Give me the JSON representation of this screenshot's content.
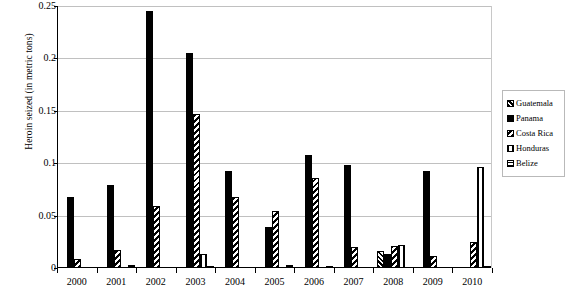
{
  "chart_data": {
    "type": "bar",
    "title": "",
    "xlabel": "",
    "ylabel": "Heroin seized (in metric tons)",
    "categories": [
      "2000",
      "2001",
      "2002",
      "2003",
      "2004",
      "2005",
      "2006",
      "2007",
      "2008",
      "2009",
      "2010"
    ],
    "ylim": [
      0,
      0.25
    ],
    "ytick_labels": [
      "0",
      "0.05",
      "0.1",
      "0.15",
      "0.2",
      "0.25"
    ],
    "ytick_values": [
      0,
      0.05,
      0.1,
      0.15,
      0.2,
      0.25
    ],
    "grid": true,
    "legend_position": "right",
    "series": [
      {
        "name": "Guatemala",
        "pattern": "diagonal-up-hatch",
        "values": [
          0,
          0,
          0,
          0,
          0,
          0,
          0,
          0,
          0.016,
          0,
          0
        ]
      },
      {
        "name": "Panama",
        "pattern": "solid-black",
        "values": [
          0.068,
          0.079,
          0.245,
          0.205,
          0.093,
          0.039,
          0.108,
          0.098,
          0.013,
          0.093,
          0
        ]
      },
      {
        "name": "Costa Rica",
        "pattern": "diagonal-down-hatch",
        "values": [
          0.009,
          0.017,
          0.059,
          0.147,
          0.068,
          0.054,
          0.086,
          0.02,
          0.021,
          0.011,
          0.025
        ]
      },
      {
        "name": "Honduras",
        "pattern": "vertical-hatch",
        "values": [
          0,
          0,
          0,
          0.013,
          0,
          0,
          0,
          0,
          0.022,
          0,
          0.096
        ]
      },
      {
        "name": "Belize",
        "pattern": "horizontal-hatch",
        "values": [
          0,
          0.003,
          0,
          0.001,
          0,
          0.003,
          0.002,
          0,
          0,
          0,
          0.002
        ]
      }
    ]
  },
  "legend": {
    "items": [
      {
        "label": "Guatemala"
      },
      {
        "label": "Panama"
      },
      {
        "label": "Costa Rica"
      },
      {
        "label": "Honduras"
      },
      {
        "label": "Belize"
      }
    ]
  }
}
